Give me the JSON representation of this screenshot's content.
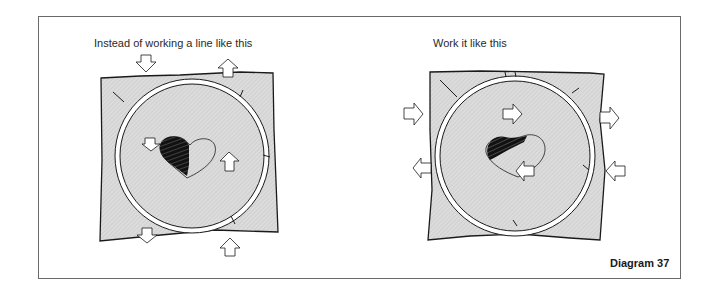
{
  "figure": {
    "label": "Diagram 37",
    "panels": [
      {
        "caption": "Instead of working a line like this",
        "description": "Fabric in embroidery hoop with half-filled heart; arrows point up/down (pulling fabric vertically)",
        "arrows": [
          "down-top-left",
          "up-top-right",
          "down-heart-left",
          "up-heart-right",
          "down-bottom-left",
          "up-bottom-right"
        ]
      },
      {
        "caption": "Work it like this",
        "description": "Fabric in embroidery hoop with half-filled heart; arrows point left/right (pulling fabric horizontally)",
        "arrows": [
          "right-left-upper",
          "left-left-lower",
          "right-heart-upper",
          "left-heart-lower",
          "right-right-upper",
          "left-right-lower"
        ]
      }
    ]
  },
  "colors": {
    "fabric": "#d9d9d9",
    "stroke": "#1a1a1a",
    "frame": "#6a6a6a"
  }
}
